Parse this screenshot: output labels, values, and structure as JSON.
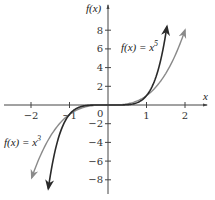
{
  "chart_data": {
    "type": "line",
    "title": "",
    "xlabel": "x",
    "ylabel": "f(x)",
    "xlim": [
      -2.5,
      2.5
    ],
    "ylim": [
      -9,
      10
    ],
    "x_ticks": [
      -2,
      -1,
      1,
      2
    ],
    "x_tick_labels": [
      "−2",
      "−1",
      "1",
      "2"
    ],
    "y_ticks": [
      -8,
      -6,
      -4,
      -2,
      2,
      4,
      6,
      8
    ],
    "y_tick_labels": [
      "−8",
      "−6",
      "−4",
      "−2",
      "2",
      "4",
      "6",
      "8"
    ],
    "origin_label": "0",
    "grid": false,
    "series": [
      {
        "name": "f(x) = x^5",
        "label_text": "f(x) = x",
        "label_exp": "5",
        "color": "#2a2a2a",
        "x": [
          -1.55,
          -1.4,
          -1.2,
          -1.0,
          -0.8,
          -0.6,
          -0.4,
          -0.2,
          0,
          0.2,
          0.4,
          0.6,
          0.8,
          1.0,
          1.2,
          1.4,
          1.53
        ],
        "values": [
          -8.95,
          -5.38,
          -2.49,
          -1.0,
          -0.33,
          -0.08,
          -0.01,
          0.0,
          0,
          0.0,
          0.01,
          0.08,
          0.33,
          1.0,
          2.49,
          5.38,
          8.41
        ]
      },
      {
        "name": "f(x) = x^3",
        "label_text": "f(x) = x",
        "label_exp": "3",
        "color": "#8a8a8a",
        "x": [
          -2.0,
          -1.8,
          -1.6,
          -1.4,
          -1.2,
          -1.0,
          -0.8,
          -0.6,
          -0.4,
          -0.2,
          0,
          0.2,
          0.4,
          0.6,
          0.8,
          1.0,
          1.2,
          1.4,
          1.6,
          1.8,
          2.0
        ],
        "values": [
          -8.0,
          -5.83,
          -4.1,
          -2.74,
          -1.73,
          -1.0,
          -0.51,
          -0.22,
          -0.06,
          -0.01,
          0,
          0.01,
          0.06,
          0.22,
          0.51,
          1.0,
          1.73,
          2.74,
          4.1,
          5.83,
          8.0
        ]
      }
    ],
    "annotations": [
      {
        "text": "f(x) = x^5",
        "near": [
          0.5,
          6
        ]
      },
      {
        "text": "f(x) = x^3",
        "near": [
          -2.3,
          -3.5
        ]
      }
    ]
  },
  "labels": {
    "y_axis": "f(x)",
    "x_axis": "x",
    "origin": "0",
    "x5_label": "f(x) = x",
    "x5_exp": "5",
    "x3_label": "f(x) = x",
    "x3_exp": "3"
  }
}
